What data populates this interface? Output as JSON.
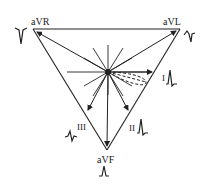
{
  "diagram": {
    "title": "",
    "leads": {
      "aVR": {
        "label": "aVR",
        "waveform": "negative-deflection"
      },
      "aVL": {
        "label": "aVL",
        "waveform": "biphasic"
      },
      "aVF": {
        "label": "aVF",
        "waveform": "small-upright"
      },
      "I": {
        "label": "I",
        "waveform": "upright-qrs"
      },
      "II": {
        "label": "II",
        "waveform": "upright-qrs"
      },
      "III": {
        "label": "III",
        "waveform": "biphasic-small"
      }
    },
    "annotations": {
      "center": "hexaxial-reference-hub",
      "vector_loop": "dashed-qrs-loop"
    }
  }
}
